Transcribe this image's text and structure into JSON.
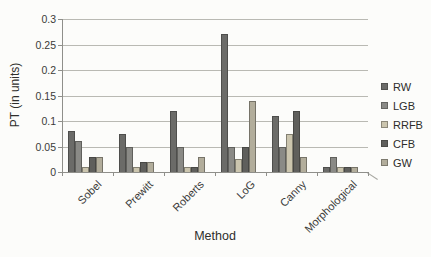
{
  "figure": {
    "background_color": "#fcfcfa",
    "gridline_color": "#b9b9b3",
    "axis_color": "#8f8f8a"
  },
  "chart_data": {
    "type": "bar",
    "title": "",
    "xlabel": "Method",
    "ylabel": "PT (in units)",
    "ylim": [
      0,
      0.3
    ],
    "ytick_labels": [
      "0",
      "0.05",
      "0.1",
      "0.15",
      "0.2",
      "0.25",
      "0.3"
    ],
    "grid": "horizontal",
    "legend_position": "right",
    "categories": [
      "Sobel",
      "Prewitt",
      "Roberts",
      "LoG",
      "Canny",
      "Morphological"
    ],
    "series": [
      {
        "name": "RW",
        "color": "#6b6b68",
        "values": [
          0.08,
          0.075,
          0.12,
          0.27,
          0.11,
          0.01
        ]
      },
      {
        "name": "LGB",
        "color": "#8a8a86",
        "values": [
          0.06,
          0.05,
          0.05,
          0.05,
          0.05,
          0.03
        ]
      },
      {
        "name": "RRFB",
        "color": "#cbc5ae",
        "values": [
          0.01,
          0.01,
          0.01,
          0.025,
          0.075,
          0.01
        ]
      },
      {
        "name": "CFB",
        "color": "#5f5f5c",
        "values": [
          0.03,
          0.02,
          0.01,
          0.05,
          0.12,
          0.01
        ]
      },
      {
        "name": "GW",
        "color": "#b2ad9b",
        "values": [
          0.03,
          0.02,
          0.03,
          0.14,
          0.03,
          0.01
        ]
      }
    ]
  }
}
